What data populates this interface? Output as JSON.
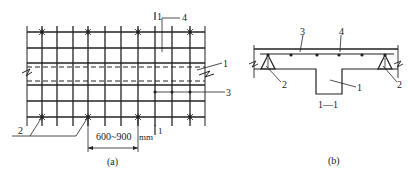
{
  "figure": {
    "panel_a": {
      "caption": "(a)",
      "dimension_label": "600~900",
      "unit_label": "mm",
      "section_mark": "1",
      "callouts": {
        "label_1": "1",
        "label_2": "2",
        "label_3": "3",
        "label_4": "4"
      }
    },
    "panel_b": {
      "caption": "(b)",
      "section_title": "1—1",
      "callouts": {
        "label_1": "1",
        "label_2_left": "2",
        "label_2_right": "2",
        "label_3": "3",
        "label_4": "4"
      }
    }
  },
  "colors": {
    "line": "#222222",
    "background": "#ffffff"
  }
}
